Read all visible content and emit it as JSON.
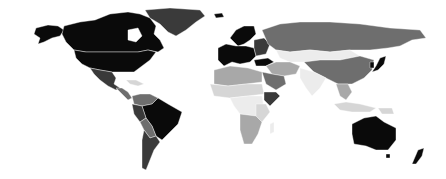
{
  "map": {
    "type": "choropleth",
    "projection": "world",
    "palette": {
      "very_high": "#0a0a0a",
      "high": "#3a3a3a",
      "medium": "#6e6e6e",
      "low": "#a8a8a8",
      "very_low": "#d6d6d6",
      "minimal": "#ececec",
      "background": "#ffffff"
    },
    "regions": [
      {
        "name": "Canada",
        "shade": "very_high"
      },
      {
        "name": "United States",
        "shade": "very_high"
      },
      {
        "name": "Alaska",
        "shade": "very_high"
      },
      {
        "name": "Greenland",
        "shade": "high"
      },
      {
        "name": "Mexico",
        "shade": "high"
      },
      {
        "name": "Central America",
        "shade": "medium"
      },
      {
        "name": "Caribbean",
        "shade": "very_low"
      },
      {
        "name": "Colombia/Venezuela",
        "shade": "medium"
      },
      {
        "name": "Brazil",
        "shade": "very_high"
      },
      {
        "name": "Peru",
        "shade": "high"
      },
      {
        "name": "Bolivia/Paraguay",
        "shade": "medium"
      },
      {
        "name": "Argentina/Chile",
        "shade": "high"
      },
      {
        "name": "Europe (Western)",
        "shade": "very_high"
      },
      {
        "name": "Scandinavia",
        "shade": "very_high"
      },
      {
        "name": "Iceland",
        "shade": "very_high"
      },
      {
        "name": "Eastern Europe",
        "shade": "high"
      },
      {
        "name": "Turkey",
        "shade": "very_high"
      },
      {
        "name": "Russia",
        "shade": "medium"
      },
      {
        "name": "Kazakhstan/Mongolia",
        "shade": "minimal"
      },
      {
        "name": "China",
        "shade": "medium"
      },
      {
        "name": "Japan",
        "shade": "very_high"
      },
      {
        "name": "Korea",
        "shade": "very_high"
      },
      {
        "name": "Middle East",
        "shade": "low"
      },
      {
        "name": "Saudi Arabia",
        "shade": "medium"
      },
      {
        "name": "India",
        "shade": "minimal"
      },
      {
        "name": "Southeast Asia",
        "shade": "low"
      },
      {
        "name": "Indonesia",
        "shade": "very_low"
      },
      {
        "name": "North Africa",
        "shade": "low"
      },
      {
        "name": "Sahel",
        "shade": "very_low"
      },
      {
        "name": "Central Africa",
        "shade": "minimal"
      },
      {
        "name": "East Africa",
        "shade": "very_low"
      },
      {
        "name": "Somalia/Ethiopia",
        "shade": "high"
      },
      {
        "name": "Southern Africa",
        "shade": "low"
      },
      {
        "name": "Madagascar",
        "shade": "minimal"
      },
      {
        "name": "Australia",
        "shade": "very_high"
      },
      {
        "name": "New Zealand",
        "shade": "very_high"
      },
      {
        "name": "Papua New Guinea",
        "shade": "very_low"
      }
    ]
  }
}
